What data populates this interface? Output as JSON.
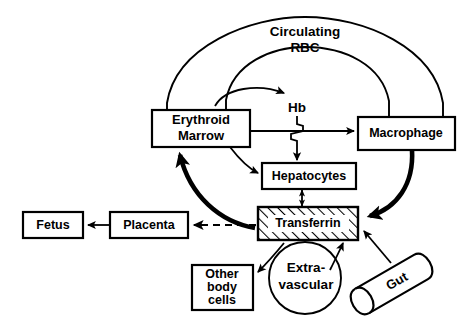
{
  "diagram": {
    "nodes": {
      "circulating_rbc_line1": "Circulating",
      "circulating_rbc_line2": "RBC",
      "erythroid_marrow_line1": "Erythroid",
      "erythroid_marrow_line2": "Marrow",
      "hb": "Hb",
      "macrophage": "Macrophage",
      "hepatocytes": "Hepatocytes",
      "transferrin": "Transferrin",
      "fetus": "Fetus",
      "placenta": "Placenta",
      "other_body_cells_line1": "Other",
      "other_body_cells_line2": "body",
      "other_body_cells_line3": "cells",
      "extravascular_line1": "Extra-",
      "extravascular_line2": "vascular",
      "gut": "Gut"
    },
    "colors": {
      "stroke": "#000000",
      "background": "#ffffff",
      "fill": "#ffffff"
    }
  }
}
